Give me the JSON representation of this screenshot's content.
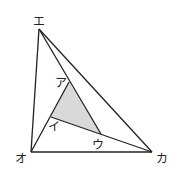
{
  "diagram": {
    "type": "geometry-triangle",
    "shaded_color": "#d9d9d9",
    "line_color": "#222222",
    "points": {
      "e": {
        "label": "エ",
        "x": 39,
        "y": 29
      },
      "o": {
        "label": "オ",
        "x": 31,
        "y": 152
      },
      "ka": {
        "label": "カ",
        "x": 152,
        "y": 152
      },
      "a": {
        "label": "ア",
        "x": 69,
        "y": 82
      },
      "i": {
        "label": "イ",
        "x": 51,
        "y": 117
      },
      "u": {
        "label": "ウ",
        "x": 101,
        "y": 134
      }
    },
    "labels": {
      "e": "エ",
      "o": "オ",
      "ka": "カ",
      "a": "ア",
      "i": "イ",
      "u": "ウ"
    }
  }
}
